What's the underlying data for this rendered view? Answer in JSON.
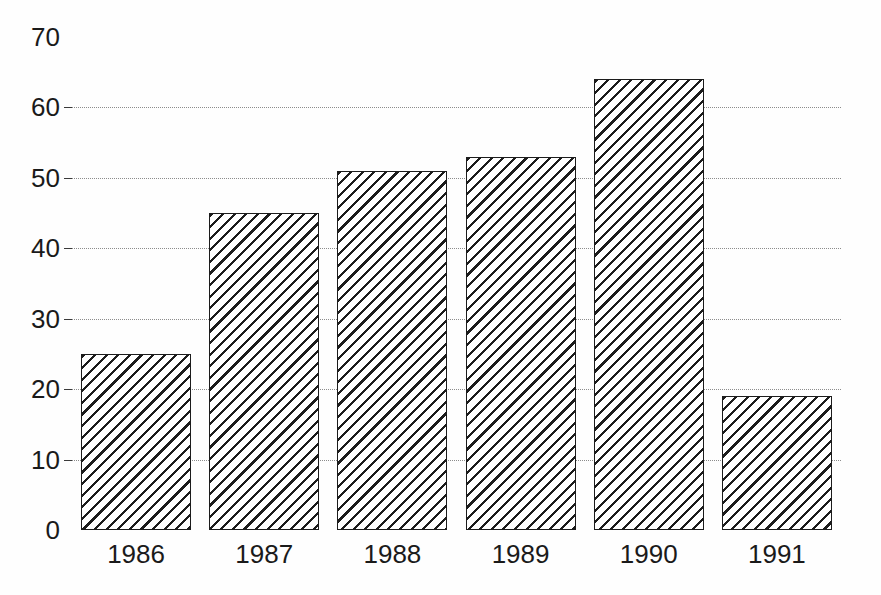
{
  "chart_data": {
    "type": "bar",
    "title": "",
    "subtitle": "",
    "xlabel": "",
    "ylabel": "",
    "categories": [
      "1986",
      "1987",
      "1988",
      "1989",
      "1990",
      "1991"
    ],
    "values": [
      25,
      45,
      51,
      53,
      64,
      19
    ],
    "series": [
      {
        "name": "",
        "values": [
          25,
          45,
          51,
          53,
          64,
          19
        ]
      }
    ],
    "ylim": [
      0,
      70
    ],
    "yticks": [
      0,
      10,
      20,
      30,
      40,
      50,
      60,
      70
    ],
    "ytick_labels": [
      "0",
      "10",
      "20",
      "30",
      "40",
      "50",
      "60",
      "70"
    ],
    "xtick_labels": [
      "1986",
      "1987",
      "1988",
      "1989",
      "1990",
      "1991"
    ],
    "grid": true,
    "grid_axis": "y",
    "grid_style": "dotted",
    "legend": false,
    "legend_position": "none",
    "bar_fill": "diagonal-hatch",
    "bar_edge_color": "#1c1c1c",
    "bar_face_color": "#ffffff",
    "grid_color": "#8c8c8c",
    "axis_color": "#3a3a3a",
    "text_color": "#1a1a1a",
    "background_color": "#ffffff"
  }
}
